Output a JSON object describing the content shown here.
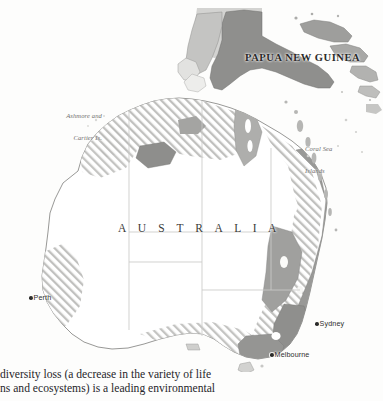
{
  "figure": {
    "name": "map-of-australia-biodiversity",
    "background_color": "#fdfdfc",
    "labels": {
      "papua_new_guinea": "PAPUA NEW GUINEA",
      "australia": "A U S T R A L I A",
      "ashmore_cartier_line1": "Ashmore and",
      "ashmore_cartier_line2": "Cartier Is.",
      "coral_sea_line1": "Coral Sea",
      "coral_sea_line2": "Islands"
    },
    "cities": [
      {
        "name": "Perth",
        "marker": "city-dot"
      },
      {
        "name": "Sydney",
        "marker": "city-dot"
      },
      {
        "name": "Melbourne",
        "marker": "city-dot"
      }
    ],
    "legend_colors": {
      "land_fill": "#ffffff",
      "hatched_region": "#b9b9b7",
      "dark_region": "#9a9a98",
      "mid_region": "#c9c9c7",
      "coastline": "#8a8a88",
      "state_boundary": "#c8c8c6",
      "label_text": "#4a4a48"
    }
  },
  "body_text": {
    "line1": "diversity loss (a decrease in the variety of life",
    "line2": "ns and ecosystems) is a leading environmental"
  }
}
